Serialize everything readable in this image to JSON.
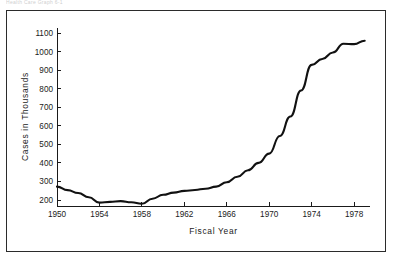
{
  "figure": {
    "top_caption": "Health Care Graph 6-1",
    "border_color": "#2b2b2b",
    "background": "#ffffff"
  },
  "chart_data": {
    "type": "line",
    "title": "",
    "xlabel": "Fiscal Year",
    "ylabel": "Cases in Thousands",
    "xlim": [
      1950,
      1979.5
    ],
    "ylim": [
      150,
      1100
    ],
    "grid": false,
    "legend": "none",
    "line_color": "#111111",
    "x_ticks": [
      1950,
      1954,
      1958,
      1962,
      1966,
      1970,
      1974,
      1978
    ],
    "x_tick_labels": [
      "1950",
      "1954",
      "1958",
      "1962",
      "1966",
      "1970",
      "1974",
      "1978"
    ],
    "y_ticks": [
      200,
      300,
      400,
      500,
      600,
      700,
      800,
      900,
      1000,
      1100
    ],
    "y_tick_labels": [
      "200",
      "300",
      "400",
      "500",
      "600",
      "700",
      "800",
      "900",
      "1000",
      "1100"
    ],
    "x": [
      1950,
      1951,
      1952,
      1953,
      1954,
      1955,
      1956,
      1957,
      1958,
      1959,
      1960,
      1961,
      1962,
      1963,
      1964,
      1965,
      1966,
      1967,
      1968,
      1969,
      1970,
      1971,
      1972,
      1973,
      1974,
      1975,
      1976,
      1977,
      1978,
      1979
    ],
    "values": [
      272,
      253,
      238,
      215,
      186,
      190,
      194,
      188,
      180,
      207,
      228,
      240,
      249,
      254,
      261,
      272,
      296,
      325,
      360,
      400,
      450,
      545,
      650,
      790,
      928,
      960,
      995,
      1042,
      1040,
      1058
    ],
    "series": [
      {
        "name": "Cases",
        "values": [
          272,
          253,
          238,
          215,
          186,
          190,
          194,
          188,
          180,
          207,
          228,
          240,
          249,
          254,
          261,
          272,
          296,
          325,
          360,
          400,
          450,
          545,
          650,
          790,
          928,
          960,
          995,
          1042,
          1040,
          1058
        ]
      }
    ]
  }
}
